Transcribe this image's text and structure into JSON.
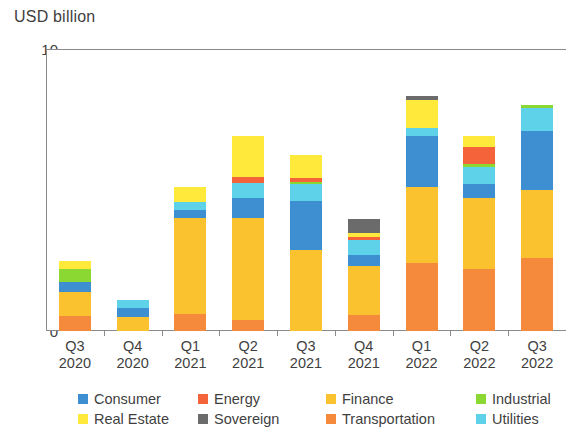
{
  "chart_data": {
    "type": "bar",
    "stacked": true,
    "title": "USD billion",
    "xlabel": "",
    "ylabel": "USD billion",
    "ylim": [
      0,
      10
    ],
    "yticks": [
      0,
      2,
      4,
      6,
      8,
      10
    ],
    "ytick_labels": [
      "0",
      "2",
      "4",
      "6",
      "8",
      "10"
    ],
    "grid": false,
    "legend_position": "bottom",
    "categories": [
      {
        "quarter": "Q3",
        "year": "2020"
      },
      {
        "quarter": "Q4",
        "year": "2020"
      },
      {
        "quarter": "Q1",
        "year": "2021"
      },
      {
        "quarter": "Q2",
        "year": "2021"
      },
      {
        "quarter": "Q3",
        "year": "2021"
      },
      {
        "quarter": "Q4",
        "year": "2021"
      },
      {
        "quarter": "Q1",
        "year": "2022"
      },
      {
        "quarter": "Q2",
        "year": "2022"
      },
      {
        "quarter": "Q3",
        "year": "2022"
      }
    ],
    "series": [
      {
        "name": "Transportation",
        "color": "#F58A3C",
        "values": [
          0.55,
          0.0,
          0.62,
          0.38,
          0.0,
          0.58,
          2.4,
          2.2,
          2.6
        ]
      },
      {
        "name": "Finance",
        "color": "#F9C22E",
        "values": [
          0.85,
          0.5,
          3.38,
          3.62,
          2.88,
          1.72,
          2.7,
          2.5,
          2.4
        ]
      },
      {
        "name": "Consumer",
        "color": "#3D8FD1",
        "values": [
          0.35,
          0.3,
          0.28,
          0.72,
          1.72,
          0.4,
          1.8,
          0.5,
          2.1
        ]
      },
      {
        "name": "Utilities",
        "color": "#5ED2E8",
        "values": [
          0.0,
          0.3,
          0.3,
          0.52,
          0.6,
          0.52,
          0.3,
          0.6,
          0.8
        ]
      },
      {
        "name": "Industrial",
        "color": "#8CD832",
        "values": [
          0.45,
          0.0,
          0.0,
          0.0,
          0.08,
          0.0,
          0.0,
          0.12,
          0.1
        ]
      },
      {
        "name": "Energy",
        "color": "#F4633A",
        "values": [
          0.0,
          0.0,
          0.0,
          0.22,
          0.15,
          0.12,
          0.0,
          0.6,
          0.0
        ]
      },
      {
        "name": "Real Estate",
        "color": "#FFE93B",
        "values": [
          0.3,
          0.0,
          0.52,
          1.44,
          0.82,
          0.12,
          1.0,
          0.4,
          0.0
        ]
      },
      {
        "name": "Sovereign",
        "color": "#6B6B6B",
        "values": [
          0.0,
          0.0,
          0.0,
          0.0,
          0.0,
          0.52,
          0.12,
          0.0,
          0.0
        ]
      }
    ],
    "totals": [
      2.5,
      1.1,
      5.1,
      6.9,
      6.25,
      3.98,
      8.32,
      6.92,
      8.0
    ]
  },
  "legend": {
    "items": [
      {
        "label": "Consumer",
        "color": "#3D8FD1"
      },
      {
        "label": "Energy",
        "color": "#F4633A"
      },
      {
        "label": "Finance",
        "color": "#F9C22E"
      },
      {
        "label": "Industrial",
        "color": "#8CD832"
      },
      {
        "label": "Real Estate",
        "color": "#FFE93B"
      },
      {
        "label": "Sovereign",
        "color": "#6B6B6B"
      },
      {
        "label": "Transportation",
        "color": "#F58A3C"
      },
      {
        "label": "Utilities",
        "color": "#5ED2E8"
      }
    ]
  },
  "axis": {
    "frame_color": "#8A8A8A",
    "text_color": "#3F3F3F"
  }
}
